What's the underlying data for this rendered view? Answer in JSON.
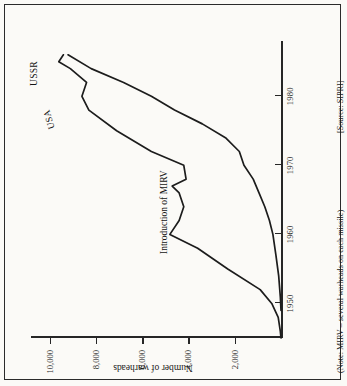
{
  "chart_data": {
    "type": "line",
    "title": "",
    "subtitle": "",
    "xlabel": "",
    "ylabel": "Number of warheads",
    "xlim": [
      1945,
      1988
    ],
    "ylim": [
      0,
      10800
    ],
    "grid": false,
    "legend": "inline-end-labels",
    "x_ticks": [
      1950,
      1960,
      1970,
      1980
    ],
    "x_tick_labels": [
      "1950",
      "1960",
      "1970",
      "1980"
    ],
    "y_ticks": [
      2000,
      4000,
      6000,
      8000,
      10000
    ],
    "y_tick_labels": [
      "2,000",
      "4,000",
      "6,000",
      "8,000",
      "10,000"
    ],
    "annotations": [
      {
        "name": "mirv-annotation",
        "text": "Introduction of MIRV",
        "x": 1968,
        "y": 3000
      }
    ],
    "series": [
      {
        "name": "USA",
        "color": "#1c1c1c",
        "x": [
          1945,
          1946,
          1948,
          1950,
          1952,
          1955,
          1958,
          1960,
          1962,
          1964,
          1966,
          1967,
          1968,
          1970,
          1972,
          1975,
          1978,
          1980,
          1982,
          1984,
          1985,
          1986
        ],
        "values": [
          0,
          30,
          120,
          400,
          900,
          2300,
          3600,
          4800,
          4400,
          4200,
          4400,
          4700,
          4100,
          4200,
          5600,
          7100,
          8300,
          8600,
          8400,
          9100,
          9600,
          9400
        ]
      },
      {
        "name": "USSR",
        "color": "#1c1c1c",
        "x": [
          1949,
          1951,
          1954,
          1957,
          1960,
          1962,
          1964,
          1966,
          1968,
          1970,
          1972,
          1974,
          1976,
          1978,
          1980,
          1982,
          1984,
          1986
        ],
        "values": [
          0,
          30,
          100,
          220,
          350,
          500,
          700,
          950,
          1200,
          1600,
          1800,
          2400,
          3400,
          4600,
          5600,
          6800,
          8200,
          9200
        ]
      }
    ]
  },
  "series_labels": {
    "usa": "USA",
    "ussr": "USSR"
  },
  "notes": {
    "mirv": "(Note: MIRV – several warheads on each missile)",
    "source": "[Source: SIPRI]"
  }
}
